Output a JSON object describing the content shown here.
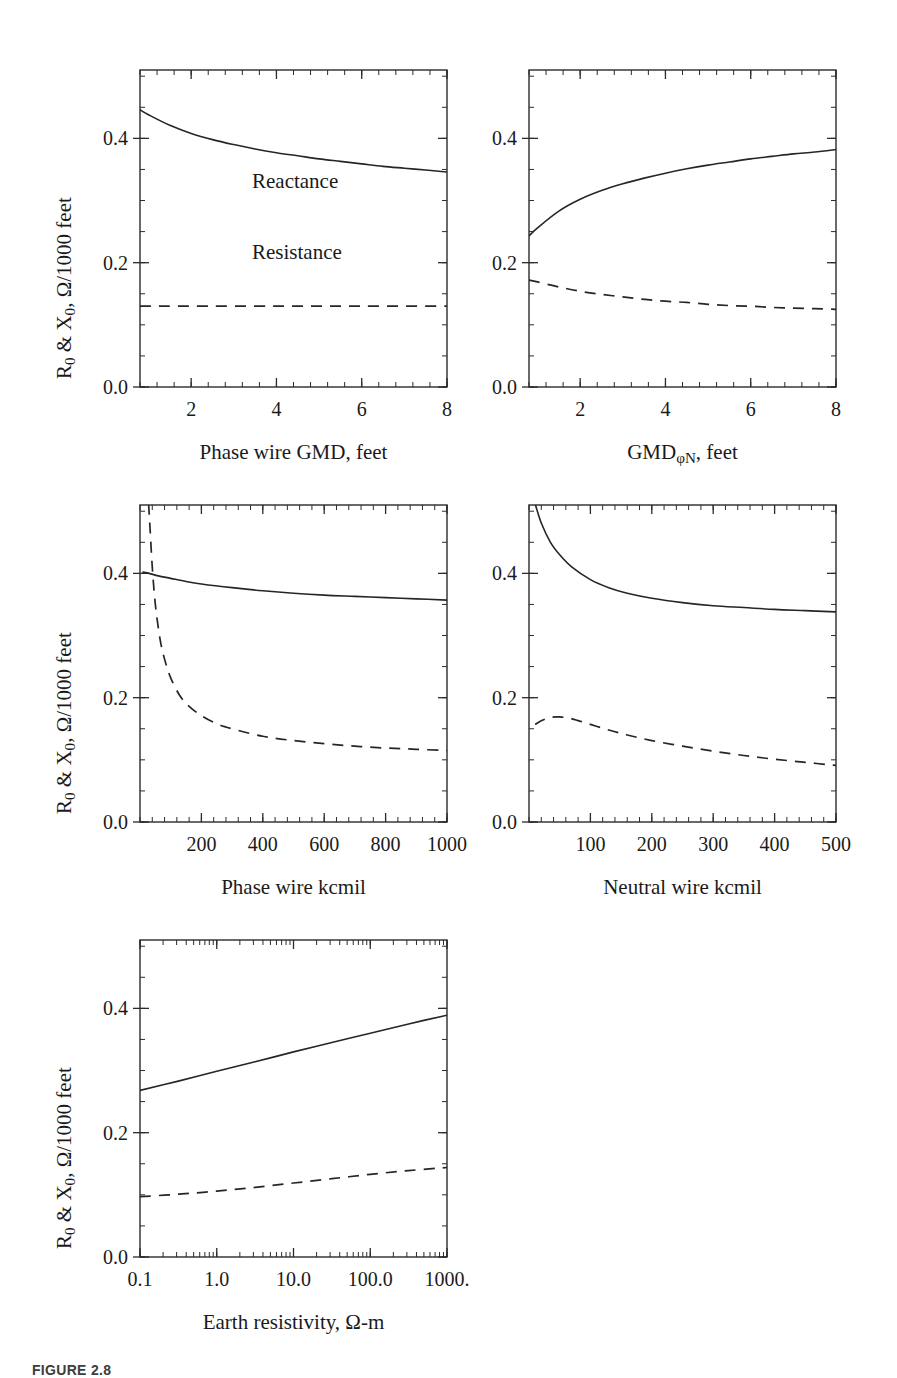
{
  "figure": {
    "caption": "FIGURE 2.8",
    "shared_y_axis_label": "R0 & X0, Ω/1000 feet",
    "shared_y_ticks": [
      "0.0",
      "0.2",
      "0.4"
    ],
    "series_names": [
      "Reactance",
      "Resistance"
    ],
    "line_styles": {
      "reactance": "solid",
      "resistance": "dashed"
    },
    "stroke_color": "#262626",
    "background": "#ffffff"
  },
  "annotations": {
    "reactance_label": "Reactance",
    "resistance_label": "Resistance"
  },
  "chart_data": [
    {
      "id": "panel-phase-wire-gmd",
      "type": "line",
      "title": "",
      "xlabel": "Phase wire GMD, feet",
      "ylabel": "R0 & X0, Ω/1000 feet",
      "xscale": "linear",
      "yscale": "linear",
      "xlim": [
        0.8,
        8.0
      ],
      "ylim": [
        0.0,
        0.51
      ],
      "xticks": [
        2,
        4,
        6,
        8
      ],
      "xticklabels": [
        "2",
        "4",
        "6",
        "8"
      ],
      "yticks": [
        0.0,
        0.2,
        0.4
      ],
      "yticklabels": [
        "0.0",
        "0.2",
        "0.4"
      ],
      "grid": false,
      "legend": "inline-annotations",
      "series": [
        {
          "name": "Reactance",
          "style": "solid",
          "x": [
            0.8,
            1.0,
            1.5,
            2.0,
            2.5,
            3.0,
            3.5,
            4.0,
            4.5,
            5.0,
            5.5,
            6.0,
            6.5,
            7.0,
            7.5,
            8.0
          ],
          "values": [
            0.446,
            0.438,
            0.421,
            0.408,
            0.398,
            0.39,
            0.383,
            0.377,
            0.372,
            0.367,
            0.363,
            0.359,
            0.355,
            0.352,
            0.349,
            0.346
          ]
        },
        {
          "name": "Resistance",
          "style": "dashed",
          "x": [
            0.8,
            2.0,
            4.0,
            6.0,
            8.0
          ],
          "values": [
            0.13,
            0.13,
            0.13,
            0.13,
            0.13
          ]
        }
      ]
    },
    {
      "id": "panel-gmd-phi-n",
      "type": "line",
      "title": "",
      "xlabel": "GMDφN, feet",
      "ylabel": "R0 & X0, Ω/1000 feet",
      "xscale": "linear",
      "yscale": "linear",
      "xlim": [
        0.8,
        8.0
      ],
      "ylim": [
        0.0,
        0.51
      ],
      "xticks": [
        2,
        4,
        6,
        8
      ],
      "xticklabels": [
        "2",
        "4",
        "6",
        "8"
      ],
      "yticks": [
        0.0,
        0.2,
        0.4
      ],
      "yticklabels": [
        "0.0",
        "0.2",
        "0.4"
      ],
      "grid": false,
      "series": [
        {
          "name": "Reactance",
          "style": "solid",
          "x": [
            0.8,
            1.0,
            1.5,
            2.0,
            2.5,
            3.0,
            3.5,
            4.0,
            4.5,
            5.0,
            5.5,
            6.0,
            6.5,
            7.0,
            7.5,
            8.0
          ],
          "values": [
            0.243,
            0.256,
            0.283,
            0.302,
            0.316,
            0.327,
            0.336,
            0.344,
            0.351,
            0.357,
            0.362,
            0.367,
            0.371,
            0.375,
            0.378,
            0.382
          ]
        },
        {
          "name": "Resistance",
          "style": "dashed",
          "x": [
            0.8,
            1.0,
            1.5,
            2.0,
            2.5,
            3.0,
            3.5,
            4.0,
            4.5,
            5.0,
            5.5,
            6.0,
            6.5,
            7.0,
            7.5,
            8.0
          ],
          "values": [
            0.172,
            0.169,
            0.161,
            0.154,
            0.149,
            0.145,
            0.141,
            0.138,
            0.136,
            0.133,
            0.131,
            0.13,
            0.128,
            0.127,
            0.126,
            0.125
          ]
        }
      ]
    },
    {
      "id": "panel-phase-wire-kcmil",
      "type": "line",
      "title": "",
      "xlabel": "Phase wire kcmil",
      "ylabel": "R0 & X0, Ω/1000 feet",
      "xscale": "linear",
      "yscale": "linear",
      "xlim": [
        0,
        1000
      ],
      "ylim": [
        0.0,
        0.51
      ],
      "xticks": [
        200,
        400,
        600,
        800,
        1000
      ],
      "xticklabels": [
        "200",
        "400",
        "600",
        "800",
        "1000"
      ],
      "yticks": [
        0.0,
        0.2,
        0.4
      ],
      "yticklabels": [
        "0.0",
        "0.2",
        "0.4"
      ],
      "grid": false,
      "series": [
        {
          "name": "Reactance",
          "style": "solid",
          "x": [
            10,
            30,
            60,
            100,
            150,
            200,
            300,
            400,
            500,
            600,
            700,
            800,
            900,
            1000
          ],
          "values": [
            0.402,
            0.4,
            0.396,
            0.392,
            0.387,
            0.383,
            0.377,
            0.372,
            0.368,
            0.365,
            0.363,
            0.361,
            0.359,
            0.357
          ]
        },
        {
          "name": "Resistance",
          "style": "dashed",
          "x": [
            28,
            33,
            40,
            50,
            65,
            80,
            100,
            130,
            160,
            200,
            250,
            300,
            400,
            500,
            600,
            700,
            800,
            900,
            1000
          ],
          "values": [
            0.512,
            0.47,
            0.41,
            0.35,
            0.295,
            0.262,
            0.232,
            0.203,
            0.186,
            0.171,
            0.158,
            0.15,
            0.138,
            0.131,
            0.126,
            0.122,
            0.119,
            0.117,
            0.115
          ]
        }
      ]
    },
    {
      "id": "panel-neutral-wire-kcmil",
      "type": "line",
      "title": "",
      "xlabel": "Neutral wire kcmil",
      "ylabel": "R0 & X0, Ω/1000 feet",
      "xscale": "linear",
      "yscale": "linear",
      "xlim": [
        0,
        500
      ],
      "ylim": [
        0.0,
        0.51
      ],
      "xticks": [
        100,
        200,
        300,
        400,
        500
      ],
      "xticklabels": [
        "100",
        "200",
        "300",
        "400",
        "500"
      ],
      "yticks": [
        0.0,
        0.2,
        0.4
      ],
      "yticklabels": [
        "0.0",
        "0.2",
        "0.4"
      ],
      "grid": false,
      "series": [
        {
          "name": "Reactance",
          "style": "solid",
          "x": [
            10,
            20,
            35,
            50,
            70,
            100,
            130,
            160,
            200,
            250,
            300,
            350,
            400,
            450,
            500
          ],
          "values": [
            0.512,
            0.481,
            0.45,
            0.43,
            0.41,
            0.39,
            0.377,
            0.368,
            0.36,
            0.353,
            0.348,
            0.345,
            0.342,
            0.34,
            0.338
          ]
        },
        {
          "name": "Resistance",
          "style": "dashed",
          "x": [
            10,
            20,
            35,
            50,
            70,
            100,
            130,
            160,
            200,
            250,
            300,
            350,
            400,
            450,
            500
          ],
          "values": [
            0.157,
            0.163,
            0.168,
            0.169,
            0.166,
            0.157,
            0.148,
            0.14,
            0.131,
            0.122,
            0.114,
            0.107,
            0.101,
            0.096,
            0.091
          ]
        }
      ]
    },
    {
      "id": "panel-earth-resistivity",
      "type": "line",
      "title": "",
      "xlabel": "Earth resistivity, Ω-m",
      "ylabel": "R0 & X0, Ω/1000 feet",
      "xscale": "log",
      "yscale": "linear",
      "xlim": [
        0.1,
        1000
      ],
      "ylim": [
        0.0,
        0.51
      ],
      "xticks": [
        0.1,
        1,
        10,
        100,
        1000
      ],
      "xticklabels": [
        "0.1",
        "1.0",
        "10.0",
        "100.0",
        "1000."
      ],
      "yticks": [
        0.0,
        0.2,
        0.4
      ],
      "yticklabels": [
        "0.0",
        "0.2",
        "0.4"
      ],
      "grid": false,
      "series": [
        {
          "name": "Reactance",
          "style": "solid",
          "x": [
            0.1,
            0.316,
            1,
            3.16,
            10,
            31.6,
            100,
            316,
            1000
          ],
          "values": [
            0.268,
            0.283,
            0.299,
            0.314,
            0.33,
            0.345,
            0.36,
            0.375,
            0.389
          ]
        },
        {
          "name": "Resistance",
          "style": "dashed",
          "x": [
            0.1,
            0.316,
            1,
            3.16,
            10,
            31.6,
            100,
            316,
            1000
          ],
          "values": [
            0.097,
            0.101,
            0.106,
            0.112,
            0.119,
            0.126,
            0.133,
            0.139,
            0.144
          ]
        }
      ]
    }
  ]
}
